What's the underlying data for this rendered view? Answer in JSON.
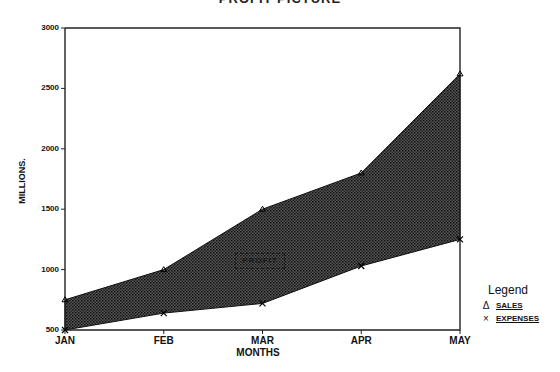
{
  "chart_data": {
    "type": "area",
    "title": "PROFIT PICTURE",
    "xlabel": "MONTHS",
    "ylabel": "MILLIONS.",
    "categories": [
      "JAN",
      "FEB",
      "MAR",
      "APR",
      "MAY"
    ],
    "series": [
      {
        "name": "SALES",
        "marker": "triangle",
        "values": [
          750,
          1000,
          1500,
          1800,
          2620
        ]
      },
      {
        "name": "EXPENSES",
        "marker": "x",
        "values": [
          500,
          640,
          720,
          1030,
          1250
        ]
      }
    ],
    "fill_between": {
      "label": "PROFIT",
      "pattern": "crosshatch",
      "color": "#2a2a2a"
    },
    "ylim": [
      500,
      3000
    ],
    "yticks": [
      500,
      1000,
      1500,
      2000,
      2500,
      3000
    ],
    "grid": false,
    "legend_position": "right-bottom"
  },
  "legend": {
    "title": "Legend",
    "items": [
      {
        "mark": "Δ",
        "label": "SALES"
      },
      {
        "mark": "×",
        "label": "EXPENSES"
      }
    ]
  },
  "annotation": {
    "label": "PROFIT"
  },
  "ytick_labels": [
    "3000",
    "2500",
    "2000",
    "1500",
    "1000",
    "500"
  ]
}
